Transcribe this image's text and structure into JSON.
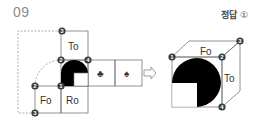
{
  "problem": {
    "number": "09"
  },
  "answer": {
    "label": "정답",
    "mark": "①"
  },
  "net": {
    "faces": {
      "top": "To",
      "front": "Fo",
      "right": "Ro",
      "club": "♣",
      "spade": "♠"
    },
    "markers": [
      "3",
      "2",
      "4",
      "1",
      "2",
      "3"
    ]
  },
  "arrow": {
    "icon": "⇨"
  },
  "cube": {
    "faces": {
      "top": "Fo",
      "side": "To"
    },
    "markers": [
      "1",
      "2",
      "3",
      "4"
    ]
  },
  "colors": {
    "line": "#777777",
    "dashed": "#9a9a9a",
    "fill": "#000000",
    "marker": "#3a3a3a"
  }
}
